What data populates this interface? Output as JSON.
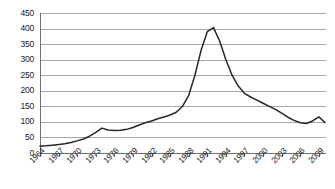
{
  "chart_data": {
    "type": "line",
    "title": "",
    "subtitle": "",
    "xlabel": "",
    "ylabel": "",
    "ylim": [
      0,
      450
    ],
    "xlim": [
      1964,
      2010
    ],
    "grid": true,
    "legend": false,
    "legend_position": "none",
    "line_color": "#262626",
    "grid_color": "#a8a8a8",
    "axis_color": "#6f6f6f",
    "y_ticks": [
      0,
      50,
      100,
      150,
      200,
      250,
      300,
      350,
      400,
      450
    ],
    "x_tick_labels": [
      "1964",
      "1967",
      "1970",
      "1973",
      "1976",
      "1979",
      "1982",
      "1985",
      "1988",
      "1991",
      "1994",
      "1997",
      "2000",
      "2003",
      "2006",
      "2009"
    ],
    "x": [
      1964,
      1965,
      1966,
      1967,
      1968,
      1969,
      1970,
      1971,
      1972,
      1973,
      1974,
      1975,
      1976,
      1977,
      1978,
      1979,
      1980,
      1981,
      1982,
      1983,
      1984,
      1985,
      1986,
      1987,
      1988,
      1989,
      1990,
      1991,
      1992,
      1993,
      1994,
      1995,
      1996,
      1997,
      1998,
      1999,
      2000,
      2001,
      2002,
      2003,
      2004,
      2005,
      2006,
      2007,
      2008,
      2009,
      2010
    ],
    "values": [
      22,
      23,
      25,
      27,
      30,
      34,
      39,
      45,
      54,
      66,
      80,
      74,
      72,
      73,
      76,
      82,
      90,
      97,
      103,
      110,
      116,
      122,
      131,
      150,
      185,
      250,
      330,
      390,
      403,
      360,
      300,
      250,
      215,
      192,
      180,
      170,
      160,
      150,
      140,
      128,
      115,
      105,
      97,
      95,
      103,
      116,
      98
    ],
    "series": [
      {
        "name": "series-1",
        "values": [
          22,
          23,
          25,
          27,
          30,
          34,
          39,
          45,
          54,
          66,
          80,
          74,
          72,
          73,
          76,
          82,
          90,
          97,
          103,
          110,
          116,
          122,
          131,
          150,
          185,
          250,
          330,
          390,
          403,
          360,
          300,
          250,
          215,
          192,
          180,
          170,
          160,
          150,
          140,
          128,
          115,
          105,
          97,
          95,
          103,
          116,
          98
        ]
      }
    ],
    "annotations": []
  }
}
